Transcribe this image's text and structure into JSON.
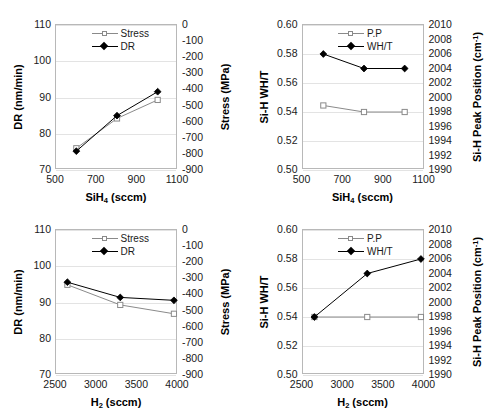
{
  "figure": {
    "panel_count": 4,
    "background": "#ffffff",
    "series_colors": {
      "stress_pp": "#8a8a8a",
      "dr_wht": "#000000"
    },
    "gridline_color": "#e3e3e3",
    "axis_border_color": "#b8b8b8"
  },
  "chart_data": [
    {
      "id": "top-left",
      "type": "line",
      "title": "",
      "xlabel": "SiH4 (sccm)",
      "xlabel_html": "SiH<sub>4</sub> (sccm)",
      "ylabel": "DR (nm/min)",
      "ylabel_right": "Stress (MPa)",
      "x": [
        600,
        800,
        1000
      ],
      "xlim": [
        500,
        1100
      ],
      "xticks": [
        500,
        700,
        900,
        1100
      ],
      "xtick_labels": [
        "500",
        "700",
        "900",
        "1100"
      ],
      "ylim": [
        70,
        110
      ],
      "yticks": [
        70,
        80,
        90,
        100,
        110
      ],
      "ytick_labels": [
        "70",
        "80",
        "90",
        "100",
        "110"
      ],
      "ylim_right": [
        -900,
        0
      ],
      "yticks_right": [
        0,
        -100,
        -200,
        -300,
        -400,
        -500,
        -600,
        -700,
        -800,
        -900
      ],
      "ytick_labels_right": [
        "0",
        "-100",
        "-200",
        "-300",
        "-400",
        "-500",
        "-600",
        "-700",
        "-800",
        "-900"
      ],
      "grid": true,
      "legend_position": "top-center",
      "series": [
        {
          "name": "Stress",
          "axis": "right",
          "marker": "open-square",
          "color": "#8a8a8a",
          "values": [
            -765,
            -580,
            -465
          ]
        },
        {
          "name": "DR",
          "axis": "left",
          "marker": "filled-diamond",
          "color": "#000000",
          "values": [
            75.2,
            85.0,
            91.6
          ]
        }
      ]
    },
    {
      "id": "top-right",
      "type": "line",
      "title": "",
      "xlabel": "SiH4 (sccm)",
      "xlabel_html": "SiH<sub>4</sub> (sccm)",
      "ylabel": "Si-H WH/T",
      "ylabel_right": "Si-H Peak Position (cm-1)",
      "x": [
        600,
        800,
        1000
      ],
      "xlim": [
        500,
        1100
      ],
      "xticks": [
        500,
        700,
        900,
        1100
      ],
      "xtick_labels": [
        "500",
        "700",
        "900",
        "1100"
      ],
      "ylim": [
        0.5,
        0.6
      ],
      "yticks": [
        0.5,
        0.52,
        0.54,
        0.56,
        0.58,
        0.6
      ],
      "ytick_labels": [
        "0.50",
        "0.52",
        "0.54",
        "0.56",
        "0.58",
        "0.60"
      ],
      "ylim_right": [
        1990,
        2010
      ],
      "yticks_right": [
        2010,
        2008,
        2006,
        2004,
        2002,
        2000,
        1998,
        1996,
        1994,
        1992,
        1990
      ],
      "ytick_labels_right": [
        "2010",
        "2008",
        "2006",
        "2004",
        "2002",
        "2000",
        "1998",
        "1996",
        "1994",
        "1992",
        "1990"
      ],
      "grid": true,
      "legend_position": "top-center",
      "series": [
        {
          "name": "P.P",
          "axis": "right",
          "marker": "open-square",
          "color": "#8a8a8a",
          "values": [
            1998.9,
            1998.0,
            1998.0
          ]
        },
        {
          "name": "WH/T",
          "axis": "left",
          "marker": "filled-diamond",
          "color": "#000000",
          "values": [
            0.58,
            0.57,
            0.57
          ]
        }
      ]
    },
    {
      "id": "bottom-left",
      "type": "line",
      "title": "",
      "xlabel": "H2 (sccm)",
      "xlabel_html": "H<sub>2</sub> (sccm)",
      "ylabel": "DR (nm/min)",
      "ylabel_right": "Stress (MPa)",
      "x": [
        2640,
        3290,
        3950
      ],
      "xlim": [
        2500,
        4000
      ],
      "xticks": [
        2500,
        3000,
        3500,
        4000
      ],
      "xtick_labels": [
        "2500",
        "3000",
        "3500",
        "4000"
      ],
      "ylim": [
        70,
        110
      ],
      "yticks": [
        70,
        80,
        90,
        100,
        110
      ],
      "ytick_labels": [
        "70",
        "80",
        "90",
        "100",
        "110"
      ],
      "ylim_right": [
        -900,
        0
      ],
      "yticks_right": [
        0,
        -100,
        -200,
        -300,
        -400,
        -500,
        -600,
        -700,
        -800,
        -900
      ],
      "ytick_labels_right": [
        "0",
        "-100",
        "-200",
        "-300",
        "-400",
        "-500",
        "-600",
        "-700",
        "-800",
        "-900"
      ],
      "grid": true,
      "legend_position": "top-center",
      "series": [
        {
          "name": "Stress",
          "axis": "right",
          "marker": "open-square",
          "color": "#8a8a8a",
          "values": [
            -340,
            -465,
            -520
          ]
        },
        {
          "name": "DR",
          "axis": "left",
          "marker": "filled-diamond",
          "color": "#000000",
          "values": [
            95.6,
            91.4,
            90.6
          ]
        }
      ]
    },
    {
      "id": "bottom-right",
      "type": "line",
      "title": "",
      "xlabel": "H2 (sccm)",
      "xlabel_html": "H<sub>2</sub> (sccm)",
      "ylabel": "Si-H WH/T",
      "ylabel_right": "Si-H Peak Position (cm-1)",
      "x": [
        2640,
        3290,
        3950
      ],
      "xlim": [
        2500,
        4000
      ],
      "xticks": [
        2500,
        3000,
        3500,
        4000
      ],
      "xtick_labels": [
        "2500",
        "3000",
        "3500",
        "4000"
      ],
      "ylim": [
        0.5,
        0.6
      ],
      "yticks": [
        0.5,
        0.52,
        0.54,
        0.56,
        0.58,
        0.6
      ],
      "ytick_labels": [
        "0.50",
        "0.52",
        "0.54",
        "0.56",
        "0.58",
        "0.60"
      ],
      "ylim_right": [
        1990,
        2010
      ],
      "yticks_right": [
        2010,
        2008,
        2006,
        2004,
        2002,
        2000,
        1998,
        1996,
        1994,
        1992,
        1990
      ],
      "ytick_labels_right": [
        "2010",
        "2008",
        "2006",
        "2004",
        "2002",
        "2000",
        "1998",
        "1996",
        "1994",
        "1992",
        "1990"
      ],
      "grid": true,
      "legend_position": "top-center",
      "series": [
        {
          "name": "P.P",
          "axis": "right",
          "marker": "open-square",
          "color": "#8a8a8a",
          "values": [
            1998.0,
            1998.0,
            1998.0
          ]
        },
        {
          "name": "WH/T",
          "axis": "left",
          "marker": "filled-diamond",
          "color": "#000000",
          "values": [
            0.54,
            0.57,
            0.58
          ]
        }
      ]
    }
  ]
}
